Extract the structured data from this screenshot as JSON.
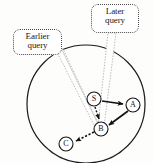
{
  "figure": {
    "boundary_shape": "circle",
    "stroke_color": "#1a1a1a",
    "background_color": "#fdfdfb"
  },
  "callouts": [
    {
      "id": "earlier",
      "line1": "Earlier",
      "line2": "query",
      "border_style": "dotted",
      "points_to": "B"
    },
    {
      "id": "later",
      "line1": "Later",
      "line2": "query",
      "border_style": "dotted",
      "points_to": "B"
    }
  ],
  "nodes": [
    {
      "id": "S",
      "label": "S",
      "cx": 94,
      "cy": 99,
      "r": 7
    },
    {
      "id": "A",
      "label": "A",
      "cx": 133,
      "cy": 105,
      "r": 7
    },
    {
      "id": "B",
      "label": "B",
      "cx": 101,
      "cy": 129,
      "r": 7
    },
    {
      "id": "C",
      "label": "C",
      "cx": 66,
      "cy": 144,
      "r": 7
    }
  ],
  "edges": [
    {
      "from": "S",
      "to": "A",
      "style": "solid",
      "arrow": true
    },
    {
      "from": "A",
      "to": "B",
      "style": "solid",
      "arrow": true
    },
    {
      "from": "S",
      "to": "B",
      "style": "dotted",
      "arrow": true
    },
    {
      "from": "B",
      "to": "C",
      "style": "dotted",
      "arrow": true
    }
  ],
  "boundary": {
    "cx": 86,
    "cy": 104,
    "r": 59
  }
}
